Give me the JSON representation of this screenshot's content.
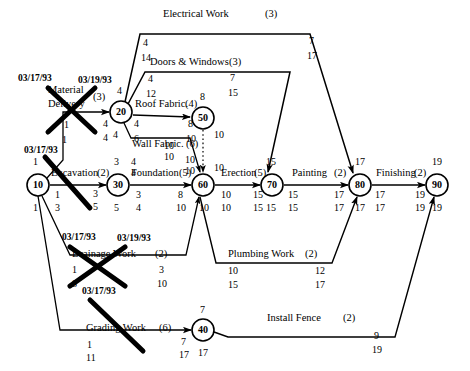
{
  "diagram": {
    "type": "pert-cpm-network",
    "stroke_color": "#000000",
    "background_color": "#ffffff"
  },
  "nodes": [
    {
      "id": "10",
      "label": "10",
      "x": 38,
      "y": 185,
      "r": 11,
      "above": "1",
      "below": "1"
    },
    {
      "id": "20",
      "label": "20",
      "x": 121,
      "y": 112,
      "r": 11,
      "above": "4",
      "below": "4"
    },
    {
      "id": "30",
      "label": "30",
      "x": 118,
      "y": 185,
      "r": 11,
      "above": "3",
      "below": "5"
    },
    {
      "id": "40",
      "label": "40",
      "x": 203,
      "y": 330,
      "r": 11,
      "above": "7",
      "below": "17"
    },
    {
      "id": "50",
      "label": "50",
      "x": 203,
      "y": 118,
      "r": 11,
      "above": "8",
      "below": "10"
    },
    {
      "id": "60",
      "label": "60",
      "x": 203,
      "y": 185,
      "r": 11,
      "above": "10",
      "below": "10"
    },
    {
      "id": "70",
      "label": "70",
      "x": 272,
      "y": 185,
      "r": 11,
      "above": "15",
      "below": "15"
    },
    {
      "id": "80",
      "label": "80",
      "x": 360,
      "y": 185,
      "r": 11,
      "above": "17",
      "below": "17"
    },
    {
      "id": "90",
      "label": "90",
      "x": 437,
      "y": 185,
      "r": 11,
      "above": "19",
      "below": "19"
    }
  ],
  "activities": [
    {
      "name": "Excavation",
      "duration": "(2)",
      "from": "10",
      "to": "30",
      "es": "1",
      "ef": "3",
      "ls": "3",
      "lf": "5"
    },
    {
      "name": "Material Delivery",
      "duration": "(3)",
      "from": "10",
      "to": "20",
      "es": "1",
      "ef": "1",
      "ls": "4",
      "lf": "4",
      "crossed": true
    },
    {
      "name": "Foundation",
      "duration": "(5)",
      "from": "30",
      "to": "60",
      "es": "3",
      "ef": "5",
      "ls": "8",
      "lf": "10"
    },
    {
      "name": "Roof Fabric.",
      "duration": "(4)",
      "from": "20",
      "to": "50",
      "es": "4",
      "ef": "4",
      "ls": "8",
      "lf": "10"
    },
    {
      "name": "Wall Fabric.",
      "duration": "(6)",
      "from": "20",
      "to": "60",
      "es": "4",
      "ef": "6",
      "ls": "10",
      "lf": "10"
    },
    {
      "name": "Electrical Work",
      "duration": "(3)",
      "from": "20",
      "to": "80",
      "es": "4",
      "ef": "14",
      "ls": "7",
      "lf": "17"
    },
    {
      "name": "Doors & Windows",
      "duration": "(3)",
      "from": "20",
      "to": "70",
      "es": "4",
      "ef": "12",
      "ls": "7",
      "lf": "15"
    },
    {
      "name": "Drainage Work",
      "duration": "(2)",
      "from": "10",
      "to": "60",
      "es": "1",
      "ef": "8",
      "ls": "3",
      "lf": "10",
      "crossed": true
    },
    {
      "name": "Grading Work",
      "duration": "(6)",
      "from": "10",
      "to": "40",
      "es": "1",
      "ef": "11",
      "ls": "7",
      "lf": "17",
      "crossed": true
    },
    {
      "name": "Erection",
      "duration": "(5)",
      "from": "60",
      "to": "70",
      "es": "10",
      "ef": "10",
      "ls": "15",
      "lf": "15"
    },
    {
      "name": "Painting",
      "duration": "(2)",
      "from": "70",
      "to": "80",
      "es": "15",
      "ef": "15",
      "ls": "17",
      "lf": "17"
    },
    {
      "name": "Finishing",
      "duration": "(2)",
      "from": "80",
      "to": "90",
      "es": "17",
      "ef": "17",
      "ls": "19",
      "lf": "19"
    },
    {
      "name": "Plumbing Work",
      "duration": "(2)",
      "from": "60",
      "to": "80",
      "es": "10",
      "ef": "15",
      "ls": "12",
      "lf": "17"
    },
    {
      "name": "Install Fence",
      "duration": "(2)",
      "from": "40",
      "to": "90",
      "es": "7",
      "ef": "17",
      "ls": "9",
      "lf": "19"
    }
  ],
  "dates": [
    {
      "id": "d1",
      "text": "03/17/93",
      "x": 18,
      "y": 76
    },
    {
      "id": "d2",
      "text": "03/19/93",
      "x": 78,
      "y": 77
    },
    {
      "id": "d3",
      "text": "03/17/93",
      "x": 24,
      "y": 148
    },
    {
      "id": "d4",
      "text": "03/17/93",
      "x": 62,
      "y": 237
    },
    {
      "id": "d5",
      "text": "03/19/93",
      "x": 117,
      "y": 238
    },
    {
      "id": "d6",
      "text": "03/17/93",
      "x": 82,
      "y": 290
    }
  ],
  "labels": {
    "electrical_work": "Electrical Work",
    "doors_windows": "Doors & Windows",
    "roof_fabric": "Roof Fabric.",
    "wall_fabric": "Wall Fabric.",
    "material_delivery_l1": "Material",
    "material_delivery_l2": "Delivery",
    "excavation": "Excavation",
    "foundation": "Foundation",
    "erection": "Erection",
    "painting": "Painting",
    "finishing": "Finishing",
    "drainage_work": "Drainage Work",
    "plumbing_work": "Plumbing Work",
    "grading_work": "Grading Work",
    "install_fence": "Install Fence",
    "dur_electrical": "(3)",
    "dur_doors": "(3)",
    "dur_roof": "(4)",
    "dur_wall": "(6)",
    "dur_material": "(3)",
    "dur_excavation": "(2)",
    "dur_foundation": "(5)",
    "dur_erection": "(5)",
    "dur_painting": "(2)",
    "dur_finishing": "(2)",
    "dur_drainage": "(2)",
    "dur_plumbing": "(2)",
    "dur_grading": "(6)",
    "dur_fence": "(2)"
  },
  "numbers": {
    "elec_es": "4",
    "elec_ef": "14",
    "elec_ls": "7",
    "elec_lf": "17",
    "door_es": "4",
    "door_ef": "12",
    "door_ls": "7",
    "door_lf": "15",
    "roof_a": "4",
    "roof_b": "8",
    "roof_c": "4",
    "roof_d": "10",
    "wall_a": "6",
    "wall_b": "10",
    "wall_c": "10",
    "wall_d": "10",
    "mat_a": "1",
    "mat_b": "1",
    "mat_c": "4",
    "mat_d": "4",
    "exc_a": "1",
    "exc_b": "3",
    "exc_c": "3",
    "exc_d": "5",
    "fnd_a": "4",
    "fnd_b": "4",
    "fnd_c": "8",
    "fnd_d": "10",
    "fnd_up1": "3",
    "fnd_up2": "5",
    "erec_a": "10",
    "erec_b": "10",
    "erec_c": "15",
    "erec_d": "15",
    "paint_a": "15",
    "paint_b": "15",
    "paint_c": "17",
    "paint_d": "17",
    "fin_a": "17",
    "fin_b": "17",
    "fin_c": "19",
    "fin_d": "19",
    "drain_a": "1",
    "drain_b": "8",
    "drain_c": "3",
    "drain_d": "10",
    "plumb_a": "10",
    "plumb_b": "15",
    "plumb_c": "12",
    "plumb_d": "17",
    "grad_a": "1",
    "grad_b": "11",
    "grad_c": "7",
    "grad_d": "17",
    "fence_a": "7",
    "fence_b": "17",
    "fence_c": "9",
    "fence_d": "19",
    "n10_top": "1",
    "n10_bot": "1",
    "n20_top": "4",
    "n20_bot": "4",
    "n30_top": "3",
    "n30_bot": "5",
    "n40_top": "7",
    "n40_bot": "17",
    "n50_top": "8",
    "n50_bot": "10",
    "n60_top": "10",
    "n60_bot": "10",
    "n70_top": "15",
    "n70_bot": "15",
    "n80_top": "17",
    "n80_bot": "17",
    "n90_top": "19",
    "n90_bot": "19",
    "dummy_a": "10"
  }
}
